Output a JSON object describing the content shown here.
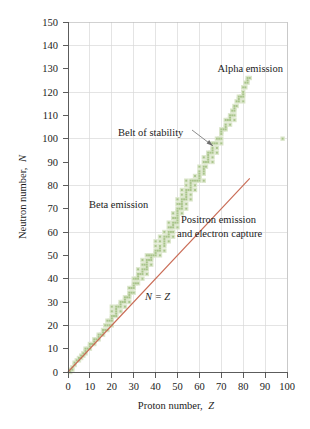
{
  "figure": {
    "title": "",
    "background_color": "#ffffff"
  },
  "axes": {
    "x_label_main": "Proton number,",
    "x_label_symbol": "Z",
    "y_label_main": "Neutron number,",
    "y_label_symbol": "N",
    "x_ticks": [
      0,
      10,
      20,
      30,
      40,
      50,
      60,
      70,
      80,
      90,
      100
    ],
    "y_ticks": [
      0,
      10,
      20,
      30,
      40,
      50,
      60,
      70,
      80,
      90,
      100,
      110,
      120,
      130,
      140,
      150
    ],
    "x_range": [
      0,
      100
    ],
    "y_range": [
      0,
      150
    ],
    "grid": true,
    "grid_color": "#d8d8d8",
    "axis_color": "#4a4a4a"
  },
  "annotations": [
    {
      "name": "alpha-emission",
      "text": "Alpha emission"
    },
    {
      "name": "belt-of-stability",
      "text": "Belt of stability"
    },
    {
      "name": "beta-emission",
      "text": "Beta emission"
    },
    {
      "name": "positron-emission-line1",
      "text": "Positron emission"
    },
    {
      "name": "positron-emission-line2",
      "text": "and electron capture"
    },
    {
      "name": "n-equals-z",
      "text": "N = Z"
    }
  ],
  "chart_data": {
    "type": "scatter",
    "xlabel": "Proton number, Z",
    "ylabel": "Neutron number, N",
    "xlim": [
      0,
      100
    ],
    "ylim": [
      0,
      150
    ],
    "grid": true,
    "legend": "none",
    "series": [
      {
        "name": "Belt of stability (stable nuclides)",
        "type": "scatter",
        "color": "#a8c48a",
        "description": "Band of stable nuclides; follows N = Z up to about Z = 20 then curves to N/Z about 1.5 near Z = 83, N = 126.",
        "points": [
          [
            1,
            0
          ],
          [
            1,
            1
          ],
          [
            2,
            1
          ],
          [
            2,
            2
          ],
          [
            3,
            3
          ],
          [
            3,
            4
          ],
          [
            4,
            5
          ],
          [
            5,
            5
          ],
          [
            5,
            6
          ],
          [
            6,
            6
          ],
          [
            6,
            7
          ],
          [
            7,
            7
          ],
          [
            7,
            8
          ],
          [
            8,
            8
          ],
          [
            8,
            9
          ],
          [
            8,
            10
          ],
          [
            9,
            10
          ],
          [
            10,
            10
          ],
          [
            10,
            11
          ],
          [
            10,
            12
          ],
          [
            11,
            12
          ],
          [
            12,
            12
          ],
          [
            12,
            13
          ],
          [
            12,
            14
          ],
          [
            13,
            14
          ],
          [
            14,
            14
          ],
          [
            14,
            15
          ],
          [
            14,
            16
          ],
          [
            15,
            16
          ],
          [
            16,
            16
          ],
          [
            16,
            17
          ],
          [
            16,
            18
          ],
          [
            17,
            18
          ],
          [
            17,
            20
          ],
          [
            18,
            18
          ],
          [
            18,
            20
          ],
          [
            18,
            22
          ],
          [
            19,
            20
          ],
          [
            19,
            22
          ],
          [
            20,
            20
          ],
          [
            20,
            22
          ],
          [
            20,
            23
          ],
          [
            20,
            24
          ],
          [
            20,
            26
          ],
          [
            20,
            28
          ],
          [
            21,
            24
          ],
          [
            22,
            24
          ],
          [
            22,
            25
          ],
          [
            22,
            26
          ],
          [
            22,
            27
          ],
          [
            22,
            28
          ],
          [
            23,
            28
          ],
          [
            24,
            26
          ],
          [
            24,
            28
          ],
          [
            24,
            29
          ],
          [
            24,
            30
          ],
          [
            25,
            30
          ],
          [
            26,
            28
          ],
          [
            26,
            30
          ],
          [
            26,
            31
          ],
          [
            26,
            32
          ],
          [
            27,
            32
          ],
          [
            28,
            30
          ],
          [
            28,
            32
          ],
          [
            28,
            33
          ],
          [
            28,
            34
          ],
          [
            28,
            36
          ],
          [
            29,
            34
          ],
          [
            29,
            36
          ],
          [
            30,
            34
          ],
          [
            30,
            36
          ],
          [
            30,
            37
          ],
          [
            30,
            38
          ],
          [
            30,
            40
          ],
          [
            31,
            38
          ],
          [
            31,
            40
          ],
          [
            32,
            38
          ],
          [
            32,
            40
          ],
          [
            32,
            41
          ],
          [
            32,
            42
          ],
          [
            32,
            44
          ],
          [
            33,
            42
          ],
          [
            34,
            40
          ],
          [
            34,
            42
          ],
          [
            34,
            43
          ],
          [
            34,
            44
          ],
          [
            34,
            46
          ],
          [
            34,
            48
          ],
          [
            35,
            44
          ],
          [
            35,
            46
          ],
          [
            36,
            42
          ],
          [
            36,
            44
          ],
          [
            36,
            45
          ],
          [
            36,
            46
          ],
          [
            36,
            47
          ],
          [
            36,
            48
          ],
          [
            36,
            50
          ],
          [
            37,
            48
          ],
          [
            37,
            50
          ],
          [
            38,
            46
          ],
          [
            38,
            48
          ],
          [
            38,
            49
          ],
          [
            38,
            50
          ],
          [
            39,
            50
          ],
          [
            40,
            50
          ],
          [
            40,
            51
          ],
          [
            40,
            52
          ],
          [
            40,
            54
          ],
          [
            40,
            56
          ],
          [
            41,
            52
          ],
          [
            42,
            50
          ],
          [
            42,
            52
          ],
          [
            42,
            53
          ],
          [
            42,
            54
          ],
          [
            42,
            56
          ],
          [
            42,
            58
          ],
          [
            44,
            52
          ],
          [
            44,
            54
          ],
          [
            44,
            55
          ],
          [
            44,
            56
          ],
          [
            44,
            57
          ],
          [
            44,
            58
          ],
          [
            44,
            60
          ],
          [
            45,
            58
          ],
          [
            46,
            56
          ],
          [
            46,
            58
          ],
          [
            46,
            59
          ],
          [
            46,
            60
          ],
          [
            46,
            62
          ],
          [
            46,
            64
          ],
          [
            47,
            60
          ],
          [
            47,
            62
          ],
          [
            48,
            58
          ],
          [
            48,
            60
          ],
          [
            48,
            62
          ],
          [
            48,
            63
          ],
          [
            48,
            64
          ],
          [
            48,
            66
          ],
          [
            48,
            68
          ],
          [
            49,
            64
          ],
          [
            49,
            66
          ],
          [
            50,
            62
          ],
          [
            50,
            64
          ],
          [
            50,
            65
          ],
          [
            50,
            66
          ],
          [
            50,
            67
          ],
          [
            50,
            68
          ],
          [
            50,
            69
          ],
          [
            50,
            70
          ],
          [
            50,
            72
          ],
          [
            50,
            74
          ],
          [
            51,
            70
          ],
          [
            51,
            72
          ],
          [
            52,
            68
          ],
          [
            52,
            70
          ],
          [
            52,
            71
          ],
          [
            52,
            72
          ],
          [
            52,
            73
          ],
          [
            52,
            74
          ],
          [
            52,
            76
          ],
          [
            52,
            78
          ],
          [
            53,
            74
          ],
          [
            54,
            70
          ],
          [
            54,
            72
          ],
          [
            54,
            74
          ],
          [
            54,
            75
          ],
          [
            54,
            76
          ],
          [
            54,
            77
          ],
          [
            54,
            78
          ],
          [
            54,
            80
          ],
          [
            54,
            82
          ],
          [
            55,
            78
          ],
          [
            56,
            74
          ],
          [
            56,
            76
          ],
          [
            56,
            78
          ],
          [
            56,
            79
          ],
          [
            56,
            80
          ],
          [
            56,
            81
          ],
          [
            56,
            82
          ],
          [
            57,
            82
          ],
          [
            58,
            78
          ],
          [
            58,
            80
          ],
          [
            58,
            82
          ],
          [
            58,
            84
          ],
          [
            59,
            82
          ],
          [
            60,
            82
          ],
          [
            60,
            83
          ],
          [
            60,
            84
          ],
          [
            60,
            85
          ],
          [
            60,
            86
          ],
          [
            60,
            88
          ],
          [
            62,
            82
          ],
          [
            62,
            85
          ],
          [
            62,
            86
          ],
          [
            62,
            87
          ],
          [
            62,
            88
          ],
          [
            62,
            90
          ],
          [
            62,
            92
          ],
          [
            63,
            88
          ],
          [
            63,
            90
          ],
          [
            64,
            90
          ],
          [
            64,
            91
          ],
          [
            64,
            92
          ],
          [
            64,
            93
          ],
          [
            64,
            94
          ],
          [
            65,
            94
          ],
          [
            66,
            90
          ],
          [
            66,
            92
          ],
          [
            66,
            94
          ],
          [
            66,
            95
          ],
          [
            66,
            96
          ],
          [
            66,
            98
          ],
          [
            67,
            98
          ],
          [
            68,
            94
          ],
          [
            68,
            96
          ],
          [
            68,
            98
          ],
          [
            98,
            100
          ],
          [
            68,
            100
          ],
          [
            69,
            100
          ],
          [
            70,
            98
          ],
          [
            70,
            100
          ],
          [
            70,
            102
          ],
          [
            70,
            103
          ],
          [
            70,
            104
          ],
          [
            71,
            104
          ],
          [
            72,
            104
          ],
          [
            72,
            105
          ],
          [
            72,
            106
          ],
          [
            72,
            108
          ],
          [
            73,
            108
          ],
          [
            74,
            106
          ],
          [
            74,
            108
          ],
          [
            74,
            109
          ],
          [
            74,
            110
          ],
          [
            75,
            110
          ],
          [
            75,
            112
          ],
          [
            76,
            108
          ],
          [
            76,
            110
          ],
          [
            76,
            112
          ],
          [
            76,
            113
          ],
          [
            76,
            114
          ],
          [
            77,
            114
          ],
          [
            77,
            116
          ],
          [
            78,
            116
          ],
          [
            78,
            117
          ],
          [
            78,
            118
          ],
          [
            79,
            118
          ],
          [
            80,
            116
          ],
          [
            80,
            118
          ],
          [
            80,
            119
          ],
          [
            80,
            120
          ],
          [
            80,
            122
          ],
          [
            81,
            122
          ],
          [
            81,
            124
          ],
          [
            82,
            124
          ],
          [
            82,
            125
          ],
          [
            82,
            126
          ],
          [
            83,
            126
          ]
        ]
      },
      {
        "name": "N = Z reference line",
        "type": "line",
        "color": "#c96b55",
        "x": [
          0,
          83
        ],
        "y": [
          0,
          83
        ]
      }
    ]
  }
}
